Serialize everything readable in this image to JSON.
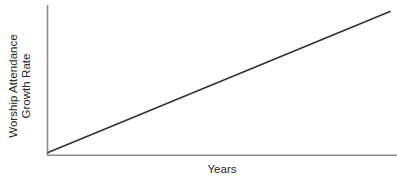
{
  "chart_data": {
    "type": "line",
    "title": "",
    "subtitle": "",
    "xlabel": "Years",
    "ylabel": "Worship Attendance Growth Rate",
    "ylabel_lines": [
      "Worship Attendance",
      "Growth Rate"
    ],
    "series": [
      {
        "name": "Worship Attendance Growth Rate",
        "x": [
          0,
          1
        ],
        "values": [
          0,
          1
        ],
        "color": "#333333"
      }
    ],
    "x": [
      0,
      1
    ],
    "xlim": [
      0,
      1
    ],
    "ylim": [
      0,
      1
    ],
    "xticks": [],
    "yticks": [],
    "xticklabels": [],
    "yticklabels": [],
    "grid": false,
    "legend": false,
    "legend_position": "none",
    "annotations": [],
    "axis_color": "#8c8c8c",
    "line_color": "#333333",
    "background_color": "#ffffff"
  },
  "axes": {
    "y_axis_name": "vertical-axis-line",
    "x_axis_name": "horizontal-axis-line"
  }
}
